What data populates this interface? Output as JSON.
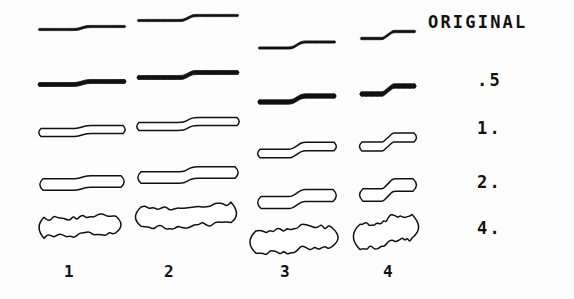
{
  "figure": {
    "background_color": "#fdfdfd",
    "ink_color": "#111111"
  },
  "row_labels": [
    {
      "id": "original",
      "text": "ORIGINAL",
      "x": 428,
      "y": 12
    },
    {
      "id": "sigma-0-5",
      "text": ".5",
      "x": 477,
      "y": 70
    },
    {
      "id": "sigma-1",
      "text": "1.",
      "x": 477,
      "y": 118
    },
    {
      "id": "sigma-2",
      "text": "2.",
      "x": 477,
      "y": 172
    },
    {
      "id": "sigma-4",
      "text": "4.",
      "x": 477,
      "y": 218
    }
  ],
  "column_labels": [
    {
      "id": "col-1",
      "text": "1",
      "x": 64,
      "y": 262
    },
    {
      "id": "col-2",
      "text": "2",
      "x": 164,
      "y": 262
    },
    {
      "id": "col-3",
      "text": "3",
      "x": 280,
      "y": 262
    },
    {
      "id": "col-4",
      "text": "4",
      "x": 383,
      "y": 262
    }
  ],
  "chart_data": {
    "type": "table",
    "title": "",
    "xlabel": "",
    "ylabel": "",
    "row_categories": [
      "ORIGINAL",
      ".5",
      "1.",
      "2.",
      "4."
    ],
    "column_categories": [
      "1",
      "2",
      "3",
      "4"
    ],
    "legend": [],
    "grid": false,
    "cells": [
      {
        "row": "ORIGINAL",
        "col": "1",
        "cx": 82,
        "cy": 28,
        "length": 86,
        "thickness": 2.2,
        "step": 3,
        "wobble": 0.0,
        "filled": true
      },
      {
        "row": "ORIGINAL",
        "col": "2",
        "cx": 188,
        "cy": 18,
        "length": 100,
        "thickness": 2.2,
        "step": 5,
        "wobble": 0.0,
        "filled": true
      },
      {
        "row": "ORIGINAL",
        "col": "3",
        "cx": 297,
        "cy": 45,
        "length": 76,
        "thickness": 2.2,
        "step": 6,
        "wobble": 0.0,
        "filled": true
      },
      {
        "row": "ORIGINAL",
        "col": "4",
        "cx": 388,
        "cy": 35,
        "length": 54,
        "thickness": 2.4,
        "step": 7,
        "wobble": 0.0,
        "filled": true
      },
      {
        "row": ".5",
        "col": "1",
        "cx": 82,
        "cy": 83,
        "length": 86,
        "thickness": 4.0,
        "step": 3,
        "wobble": 0.0,
        "filled": true
      },
      {
        "row": ".5",
        "col": "2",
        "cx": 188,
        "cy": 75,
        "length": 100,
        "thickness": 4.0,
        "step": 5,
        "wobble": 0.0,
        "filled": true
      },
      {
        "row": ".5",
        "col": "3",
        "cx": 297,
        "cy": 99,
        "length": 76,
        "thickness": 4.4,
        "step": 6,
        "wobble": 0.0,
        "filled": true
      },
      {
        "row": ".5",
        "col": "4",
        "cx": 388,
        "cy": 90,
        "length": 54,
        "thickness": 4.6,
        "step": 8,
        "wobble": 0.0,
        "filled": true
      },
      {
        "row": "1.",
        "col": "1",
        "cx": 82,
        "cy": 131,
        "length": 82,
        "thickness": 8.0,
        "step": 3,
        "wobble": 0.0,
        "filled": false
      },
      {
        "row": "1.",
        "col": "2",
        "cx": 188,
        "cy": 124,
        "length": 98,
        "thickness": 8.0,
        "step": 5,
        "wobble": 0.0,
        "filled": false
      },
      {
        "row": "1.",
        "col": "3",
        "cx": 297,
        "cy": 150,
        "length": 74,
        "thickness": 8.6,
        "step": 7,
        "wobble": 0.0,
        "filled": false
      },
      {
        "row": "1.",
        "col": "4",
        "cx": 388,
        "cy": 142,
        "length": 52,
        "thickness": 9.0,
        "step": 9,
        "wobble": 0.0,
        "filled": false
      },
      {
        "row": "2.",
        "col": "1",
        "cx": 82,
        "cy": 183,
        "length": 78,
        "thickness": 11.5,
        "step": 3,
        "wobble": 0.0,
        "filled": false
      },
      {
        "row": "2.",
        "col": "2",
        "cx": 188,
        "cy": 175,
        "length": 94,
        "thickness": 11.5,
        "step": 5,
        "wobble": 0.0,
        "filled": false
      },
      {
        "row": "2.",
        "col": "3",
        "cx": 297,
        "cy": 199,
        "length": 72,
        "thickness": 12.0,
        "step": 7,
        "wobble": 0.0,
        "filled": false
      },
      {
        "row": "2.",
        "col": "4",
        "cx": 388,
        "cy": 190,
        "length": 50,
        "thickness": 12.5,
        "step": 10,
        "wobble": 0.0,
        "filled": false
      },
      {
        "row": "4.",
        "col": "1",
        "cx": 80,
        "cy": 226,
        "length": 72,
        "thickness": 18.0,
        "step": 2,
        "wobble": 2.4,
        "filled": false
      },
      {
        "row": "4.",
        "col": "2",
        "cx": 186,
        "cy": 216,
        "length": 90,
        "thickness": 20.0,
        "step": 3,
        "wobble": 2.8,
        "filled": false
      },
      {
        "row": "4.",
        "col": "3",
        "cx": 294,
        "cy": 240,
        "length": 76,
        "thickness": 22.0,
        "step": 4,
        "wobble": 3.0,
        "filled": false
      },
      {
        "row": "4.",
        "col": "4",
        "cx": 386,
        "cy": 232,
        "length": 52,
        "thickness": 24.0,
        "step": 8,
        "wobble": 2.2,
        "filled": false
      }
    ]
  }
}
